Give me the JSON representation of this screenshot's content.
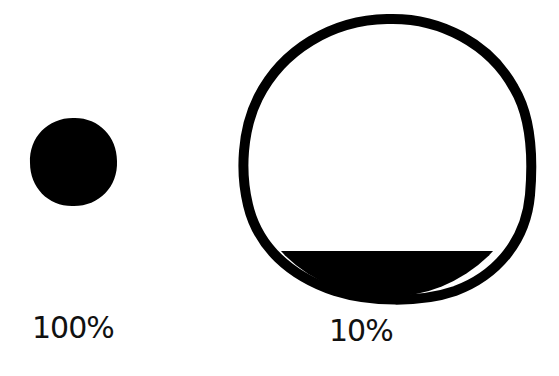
{
  "diagram": {
    "colors": {
      "ink": "#000000",
      "background": "#ffffff",
      "label": "#111111"
    },
    "items": [
      {
        "name": "small-full-circle",
        "label": "100%",
        "fill_fraction": 1.0
      },
      {
        "name": "large-partial-circle",
        "label": "10%",
        "fill_fraction": 0.1
      }
    ]
  }
}
